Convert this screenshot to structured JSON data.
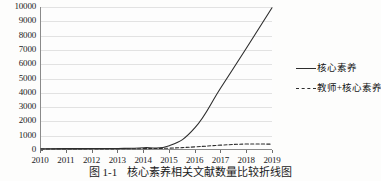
{
  "chart_data": {
    "type": "line",
    "title": "",
    "caption_number": "图 1-1",
    "caption_text": "核心素养相关文献数量比较折线图",
    "xlabel": "",
    "ylabel": "",
    "x": [
      2010,
      2011,
      2012,
      2013,
      2014,
      2015,
      2016,
      2017,
      2018,
      2019
    ],
    "xtick_labels": [
      "2010",
      "2011",
      "2012",
      "2013",
      "2014",
      "2015",
      "2016",
      "2017",
      "2018",
      "2019"
    ],
    "ytick_labels": [
      "0",
      "1000",
      "2000",
      "3000",
      "4000",
      "5000",
      "6000",
      "7000",
      "8000",
      "9000",
      "10000"
    ],
    "ytick_values": [
      0,
      1000,
      2000,
      3000,
      4000,
      5000,
      6000,
      7000,
      8000,
      9000,
      10000
    ],
    "ylim": [
      0,
      10000
    ],
    "xlim": [
      2010,
      2019
    ],
    "grid": true,
    "grid_axis": "y",
    "legend_position": "right",
    "series": [
      {
        "name": "核心素养",
        "style": "solid",
        "color": "#2d2d2d",
        "values": [
          20,
          25,
          30,
          40,
          90,
          230,
          1500,
          4300,
          7100,
          9950
        ]
      },
      {
        "name": "教师+核心素养",
        "style": "dashed",
        "color": "#2d2d2d",
        "values": [
          5,
          6,
          8,
          12,
          25,
          60,
          150,
          270,
          350,
          340
        ]
      }
    ]
  },
  "legend": {
    "entries": [
      {
        "label": "核心素养",
        "style": "solid"
      },
      {
        "label": "教师+核心素养",
        "style": "dashed"
      }
    ]
  },
  "colors": {
    "line": "#2d2d2d",
    "axis": "#8a8a8a",
    "grid": "#e2e2e2",
    "text": "#1a1a1a",
    "background": "#fdfdfc"
  }
}
